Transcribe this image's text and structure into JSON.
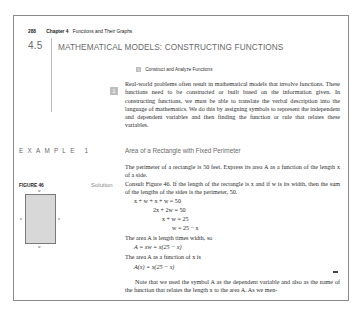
{
  "running_head": {
    "page_number": "288",
    "chapter": "Chapter 4",
    "chapter_title": "Functions and Their Graphs"
  },
  "section": {
    "number": "4.5",
    "title": "MATHEMATICAL MODELS: CONSTRUCTING FUNCTIONS"
  },
  "objective": {
    "marker": "1",
    "label": "Construct and Analyze Functions"
  },
  "intro_paragraph": "Real-world problems often result in mathematical models that involve functions. These functions need to be constructed or built based on the information given. In constructing functions, we must be able to translate the verbal description into the language of mathematics. We do this by assigning symbols to represent the independent and dependent variables and then finding the function or rule that relates these variables.",
  "example": {
    "label": "EXAMPLE 1",
    "title": "Area of a Rectangle with Fixed Perimeter",
    "problem": "The perimeter of a rectangle is 50 feet. Express its area A as a function of the length x of a side.",
    "solution_label": "Solution",
    "solution_text": "Consult Figure 46. If the length of the rectangle is x and if w is its width, then the sum of the lengths of the sides is the perimeter, 50.",
    "equations": [
      "x + w + x + w = 50",
      "2x + 2w = 50",
      "x + w = 25",
      "w = 25 − x"
    ],
    "area_text_1": "The area A is length times width, so",
    "area_eq_1": "A = xw = x(25 − x)",
    "area_text_2": "The area A as a function of x is",
    "area_eq_2": "A(x) = x(25 − x)"
  },
  "figure": {
    "label": "FIGURE 46",
    "top_label": "w",
    "bottom_label": "w",
    "left_label": "x",
    "right_label": "x",
    "fill_color": "#d8d8d8"
  },
  "note_paragraph": "Note that we used the symbol A as the dependent variable and also as the name of the function that relates the length x to the area A. As we men-"
}
